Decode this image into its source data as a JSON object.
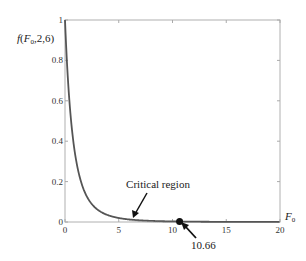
{
  "chart_data": {
    "type": "line",
    "title": "",
    "ylabel": "f(F0,2,6)",
    "ylabel_parts": {
      "f": "f",
      "open": "(",
      "F": "F",
      "sub": "0",
      "rest": ",2,6)"
    },
    "xlabel": "F",
    "xlabel_sub": "0",
    "xlim": [
      0,
      20
    ],
    "ylim": [
      0,
      1
    ],
    "xticks": [
      0,
      5,
      10,
      15,
      20
    ],
    "xtick_labels": [
      "0",
      "5",
      "10",
      "15",
      "20"
    ],
    "yticks": [
      0,
      0.2,
      0.4,
      0.6,
      0.8,
      1
    ],
    "ytick_labels": [
      "0",
      "0.2",
      "0.4",
      "0.6",
      "0.8",
      "1"
    ],
    "grid": false,
    "series": [
      {
        "name": "F-distribution pdf (2,6)",
        "df1": 2,
        "df2": 6,
        "color": "#555555"
      }
    ],
    "critical_value": 10.66,
    "annotations": [
      {
        "text": "Critical region",
        "points_to_x": 6.3
      },
      {
        "text": "10.66",
        "points_to_x": 10.66
      }
    ],
    "colors": {
      "curve": "#555555",
      "axis": "#aaaaaa",
      "marker": "#111111"
    }
  }
}
